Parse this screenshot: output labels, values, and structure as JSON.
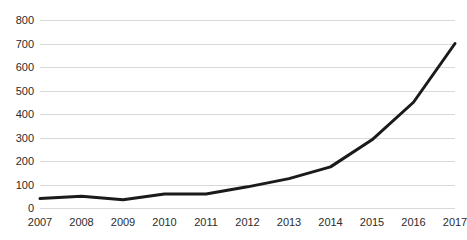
{
  "chart_data": {
    "type": "line",
    "title": "",
    "subtitle": "",
    "xlabel": "",
    "ylabel": "",
    "categories": [
      "2007",
      "2008",
      "2009",
      "2010",
      "2011",
      "2012",
      "2013",
      "2014",
      "2015",
      "2016",
      "2017"
    ],
    "values": [
      40,
      50,
      35,
      60,
      60,
      90,
      125,
      175,
      290,
      450,
      700
    ],
    "series": [
      {
        "name": "",
        "values": [
          40,
          50,
          35,
          60,
          60,
          90,
          125,
          175,
          290,
          450,
          700
        ]
      }
    ],
    "ylim": [
      0,
      800
    ],
    "yticks": [
      0,
      100,
      200,
      300,
      400,
      500,
      600,
      700,
      800
    ],
    "ytick_labels": [
      "0",
      "100",
      "200",
      "300",
      "400",
      "500",
      "600",
      "700",
      "800"
    ],
    "xtick_labels": [
      "2007",
      "2008",
      "2009",
      "2010",
      "2011",
      "2012",
      "2013",
      "2014",
      "2015",
      "2016",
      "2017"
    ],
    "grid": true,
    "grid_axis": "y",
    "legend": false,
    "legend_position": "none",
    "line_color": "#1a1a1a",
    "line_width": 3,
    "grid_color": "#d9d9d9",
    "background_color": "#ffffff",
    "tick_label_color": "#2b2b2b",
    "markers": false,
    "annotations": []
  }
}
